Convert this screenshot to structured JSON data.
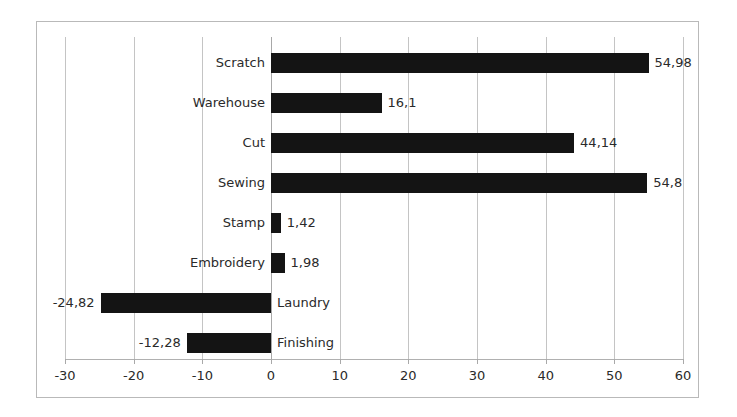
{
  "chart_data": {
    "type": "bar",
    "orientation": "horizontal",
    "title": "",
    "xlabel": "",
    "ylabel": "",
    "categories": [
      "Scratch",
      "Warehouse",
      "Cut",
      "Sewing",
      "Stamp",
      "Embroidery",
      "Laundry",
      "Finishing"
    ],
    "values": [
      54.98,
      16.1,
      44.14,
      54.8,
      1.42,
      1.98,
      -24.82,
      -12.28
    ],
    "value_labels": [
      "54,98",
      "16,1",
      "44,14",
      "54,8",
      "1,42",
      "1,98",
      "-24,82",
      "-12,28"
    ],
    "xlim": [
      -30,
      60
    ],
    "xticks": [
      -30,
      -20,
      -10,
      0,
      10,
      20,
      30,
      40,
      50,
      60
    ],
    "xtick_labels": [
      "-30",
      "-20",
      "-10",
      "0",
      "10",
      "20",
      "30",
      "40",
      "50",
      "60"
    ],
    "grid": true,
    "legend": false,
    "bar_color": "#141414",
    "gridline_color": "#c4c4c4",
    "background_color": "#ffffff",
    "border_color": "#b9b9b9",
    "decimal_separator": ","
  }
}
